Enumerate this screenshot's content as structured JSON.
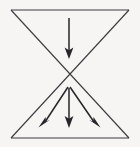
{
  "figure": {
    "canvas": {
      "width": 140,
      "height": 147
    },
    "background_color": "#f6f5f3",
    "line_color": "#3d3d42",
    "arrow_color": "#26262b",
    "geometry": {
      "top_left_vertex": "11,10",
      "top_right_vertex": "129,10",
      "bottom_left_vertex": "11,138",
      "bottom_right_vertex": "129,138",
      "crossing_point": "69,78"
    },
    "shapes": {
      "top_edge": "M 11 10 L 129 10",
      "bottom_edge": "M 11 138 L 129 138",
      "diagonal_tl_br": "M 11 10 L 129 138",
      "diagonal_tr_bl": "M 129 10 L 11 138"
    },
    "arrows": [
      {
        "name": "upper-down-arrow",
        "direction": "down",
        "shaft": "M 69 18 L 69 52",
        "head": "69,59 64.6,47.5 69,50.2 73.4,47.5"
      },
      {
        "name": "lower-down-arrow",
        "direction": "down",
        "shaft": "M 69 88 L 69 120",
        "head": "69,128 64.6,116 69,118.7 73.4,116"
      },
      {
        "name": "lower-left-arrow",
        "direction": "down-left",
        "shaft": "M 68 87 L 45 122",
        "head": "38.5,127.5 45.6,117.1 45.9,121.4 49.9,119.8"
      },
      {
        "name": "lower-right-arrow",
        "direction": "down-right",
        "shaft": "M 70 87 L 94 122",
        "head": "100.5,127.5 89.2,119.9 93.2,121.4 93.5,117.1"
      }
    ]
  }
}
